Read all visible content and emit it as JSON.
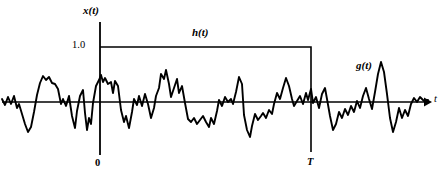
{
  "figure": {
    "type": "signal-waveform-diagram",
    "background_color": "#ffffff",
    "line_color": "#000000"
  },
  "labels": {
    "y_axis": "x(t)",
    "amplitude_level": "1.0",
    "pulse_signal": "h(t)",
    "noise_signal": "g(t)",
    "origin": "0",
    "pulse_end": "T",
    "x_axis": "t"
  },
  "chart_data": {
    "type": "line",
    "title": "",
    "xlabel": "t",
    "ylabel": "x(t)",
    "grid": false,
    "legend": "inline-annotations",
    "axes": {
      "origin_px": [
        100,
        102
      ],
      "x_axis_y_px": 102,
      "x_axis_start_px": 2,
      "x_axis_end_px": 430,
      "y_axis_top_px": 22,
      "y_axis_bottom_px": 155,
      "amplitude_1_0_y_px": 47,
      "pulse_T_x_px": 311
    },
    "series": [
      {
        "name": "h(t)",
        "description": "Unit rectangular pulse of amplitude 1.0 from t = 0 to t = T",
        "amplitude": 1.0,
        "t_start": 0,
        "t_end": "T",
        "points_px": [
          [
            100,
            47
          ],
          [
            311,
            47
          ],
          [
            311,
            152
          ]
        ]
      },
      {
        "name": "g(t)",
        "description": "Random noise waveform spanning the whole time axis",
        "mean": 0,
        "points_px": [
          [
            2,
            99
          ],
          [
            5,
            105
          ],
          [
            8,
            97
          ],
          [
            11,
            104
          ],
          [
            14,
            96
          ],
          [
            17,
            108
          ],
          [
            19,
            104
          ],
          [
            22,
            114
          ],
          [
            25,
            124
          ],
          [
            28,
            132
          ],
          [
            31,
            127
          ],
          [
            34,
            112
          ],
          [
            37,
            95
          ],
          [
            40,
            83
          ],
          [
            43,
            76
          ],
          [
            46,
            80
          ],
          [
            49,
            77
          ],
          [
            52,
            83
          ],
          [
            55,
            84
          ],
          [
            58,
            89
          ],
          [
            61,
            104
          ],
          [
            63,
            99
          ],
          [
            66,
            106
          ],
          [
            69,
            96
          ],
          [
            72,
            116
          ],
          [
            75,
            128
          ],
          [
            77,
            111
          ],
          [
            80,
            96
          ],
          [
            83,
            90
          ],
          [
            85,
            113
          ],
          [
            87,
            130
          ],
          [
            89,
            118
          ],
          [
            91,
            124
          ],
          [
            93,
            103
          ],
          [
            96,
            86
          ],
          [
            99,
            80
          ],
          [
            101,
            75
          ],
          [
            103,
            82
          ],
          [
            105,
            78
          ],
          [
            108,
            84
          ],
          [
            111,
            82
          ],
          [
            113,
            93
          ],
          [
            115,
            81
          ],
          [
            118,
            86
          ],
          [
            121,
            110
          ],
          [
            124,
            122
          ],
          [
            126,
            116
          ],
          [
            129,
            128
          ],
          [
            132,
            112
          ],
          [
            134,
            99
          ],
          [
            137,
            105
          ],
          [
            139,
            96
          ],
          [
            142,
            106
          ],
          [
            145,
            94
          ],
          [
            148,
            104
          ],
          [
            151,
            118
          ],
          [
            154,
            108
          ],
          [
            156,
            96
          ],
          [
            159,
            88
          ],
          [
            161,
            74
          ],
          [
            164,
            79
          ],
          [
            166,
            70
          ],
          [
            169,
            84
          ],
          [
            171,
            97
          ],
          [
            174,
            88
          ],
          [
            177,
            79
          ],
          [
            179,
            93
          ],
          [
            182,
            86
          ],
          [
            185,
            103
          ],
          [
            188,
            119
          ],
          [
            191,
            122
          ],
          [
            194,
            118
          ],
          [
            197,
            124
          ],
          [
            200,
            120
          ],
          [
            203,
            116
          ],
          [
            206,
            122
          ],
          [
            209,
            127
          ],
          [
            211,
            118
          ],
          [
            214,
            124
          ],
          [
            217,
            111
          ],
          [
            219,
            100
          ],
          [
            222,
            106
          ],
          [
            225,
            97
          ],
          [
            228,
            102
          ],
          [
            231,
            99
          ],
          [
            233,
            104
          ],
          [
            236,
            92
          ],
          [
            239,
            77
          ],
          [
            242,
            84
          ],
          [
            244,
            115
          ],
          [
            247,
            130
          ],
          [
            250,
            137
          ],
          [
            252,
            126
          ],
          [
            255,
            114
          ],
          [
            258,
            120
          ],
          [
            261,
            116
          ],
          [
            263,
            113
          ],
          [
            266,
            118
          ],
          [
            269,
            110
          ],
          [
            272,
            114
          ],
          [
            274,
            104
          ],
          [
            277,
            93
          ],
          [
            280,
            99
          ],
          [
            283,
            88
          ],
          [
            286,
            78
          ],
          [
            289,
            86
          ],
          [
            292,
            99
          ],
          [
            294,
            106
          ],
          [
            297,
            101
          ],
          [
            300,
            96
          ],
          [
            303,
            104
          ],
          [
            306,
            93
          ],
          [
            308,
            100
          ],
          [
            311,
            89
          ],
          [
            313,
            103
          ],
          [
            316,
            97
          ],
          [
            319,
            108
          ],
          [
            322,
            94
          ],
          [
            325,
            88
          ],
          [
            327,
            99
          ],
          [
            330,
            116
          ],
          [
            333,
            130
          ],
          [
            336,
            124
          ],
          [
            339,
            112
          ],
          [
            342,
            118
          ],
          [
            345,
            109
          ],
          [
            348,
            115
          ],
          [
            351,
            106
          ],
          [
            354,
            112
          ],
          [
            357,
            101
          ],
          [
            360,
            108
          ],
          [
            363,
            96
          ],
          [
            366,
            88
          ],
          [
            369,
            99
          ],
          [
            372,
            109
          ],
          [
            375,
            92
          ],
          [
            378,
            74
          ],
          [
            381,
            62
          ],
          [
            384,
            72
          ],
          [
            387,
            94
          ],
          [
            390,
            118
          ],
          [
            393,
            132
          ],
          [
            396,
            122
          ],
          [
            399,
            108
          ],
          [
            402,
            118
          ],
          [
            405,
            110
          ],
          [
            408,
            116
          ],
          [
            411,
            104
          ],
          [
            414,
            98
          ],
          [
            417,
            102
          ],
          [
            420,
            97
          ],
          [
            424,
            101
          ],
          [
            428,
            100
          ]
        ]
      }
    ]
  }
}
